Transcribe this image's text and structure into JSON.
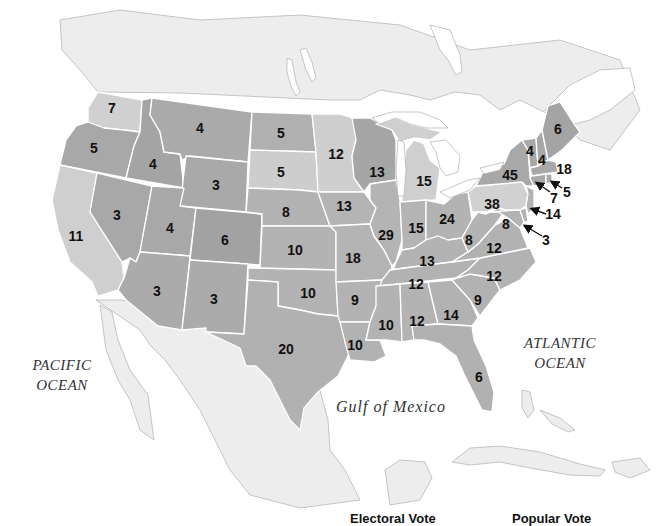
{
  "map": {
    "title": "Electoral votes by state",
    "ocean_labels": {
      "pacific_line1": "PACIFIC",
      "pacific_line2": "OCEAN",
      "atlantic_line1": "ATLANTIC",
      "atlantic_line2": "OCEAN",
      "gulf": "Gulf of Mexico"
    },
    "colors": {
      "state_dark": "#a6a6a6",
      "state_mid": "#b4b4b4",
      "state_light": "#cfcfcf",
      "border": "#ffffff",
      "label": "#111111"
    },
    "states": [
      {
        "name": "Washington",
        "abbr": "WA",
        "votes": "7",
        "shade": "light"
      },
      {
        "name": "Oregon",
        "abbr": "OR",
        "votes": "5",
        "shade": "dark"
      },
      {
        "name": "California",
        "abbr": "CA",
        "votes": "11",
        "shade": "light"
      },
      {
        "name": "Idaho",
        "abbr": "ID",
        "votes": "4",
        "shade": "dark"
      },
      {
        "name": "Nevada",
        "abbr": "NV",
        "votes": "3",
        "shade": "dark"
      },
      {
        "name": "Montana",
        "abbr": "MT",
        "votes": "4",
        "shade": "dark"
      },
      {
        "name": "Wyoming",
        "abbr": "WY",
        "votes": "3",
        "shade": "dark"
      },
      {
        "name": "Utah",
        "abbr": "UT",
        "votes": "4",
        "shade": "dark"
      },
      {
        "name": "Colorado",
        "abbr": "CO",
        "votes": "6",
        "shade": "dark"
      },
      {
        "name": "Arizona",
        "abbr": "AZ",
        "votes": "3",
        "shade": "dark"
      },
      {
        "name": "New Mexico",
        "abbr": "NM",
        "votes": "3",
        "shade": "dark"
      },
      {
        "name": "North Dakota",
        "abbr": "ND",
        "votes": "5",
        "shade": "dark"
      },
      {
        "name": "South Dakota",
        "abbr": "SD",
        "votes": "5",
        "shade": "light"
      },
      {
        "name": "Nebraska",
        "abbr": "NE",
        "votes": "8",
        "shade": "dark"
      },
      {
        "name": "Kansas",
        "abbr": "KS",
        "votes": "10",
        "shade": "dark"
      },
      {
        "name": "Oklahoma",
        "abbr": "OK",
        "votes": "10",
        "shade": "dark"
      },
      {
        "name": "Texas",
        "abbr": "TX",
        "votes": "20",
        "shade": "dark"
      },
      {
        "name": "Minnesota",
        "abbr": "MN",
        "votes": "12",
        "shade": "light"
      },
      {
        "name": "Iowa",
        "abbr": "IA",
        "votes": "13",
        "shade": "dark"
      },
      {
        "name": "Missouri",
        "abbr": "MO",
        "votes": "18",
        "shade": "dark"
      },
      {
        "name": "Arkansas",
        "abbr": "AR",
        "votes": "9",
        "shade": "dark"
      },
      {
        "name": "Louisiana",
        "abbr": "LA",
        "votes": "10",
        "shade": "dark"
      },
      {
        "name": "Wisconsin",
        "abbr": "WI",
        "votes": "13",
        "shade": "dark"
      },
      {
        "name": "Illinois",
        "abbr": "IL",
        "votes": "29",
        "shade": "dark"
      },
      {
        "name": "Michigan",
        "abbr": "MI",
        "votes": "15",
        "shade": "light"
      },
      {
        "name": "Indiana",
        "abbr": "IN",
        "votes": "15",
        "shade": "dark"
      },
      {
        "name": "Ohio",
        "abbr": "OH",
        "votes": "24",
        "shade": "dark"
      },
      {
        "name": "Kentucky",
        "abbr": "KY",
        "votes": "13",
        "shade": "dark"
      },
      {
        "name": "Tennessee",
        "abbr": "TN",
        "votes": "12",
        "shade": "dark"
      },
      {
        "name": "Mississippi",
        "abbr": "MS",
        "votes": "10",
        "shade": "dark"
      },
      {
        "name": "Alabama",
        "abbr": "AL",
        "votes": "12",
        "shade": "dark"
      },
      {
        "name": "Georgia",
        "abbr": "GA",
        "votes": "14",
        "shade": "dark"
      },
      {
        "name": "Florida",
        "abbr": "FL",
        "votes": "6",
        "shade": "dark"
      },
      {
        "name": "South Carolina",
        "abbr": "SC",
        "votes": "9",
        "shade": "dark"
      },
      {
        "name": "North Carolina",
        "abbr": "NC",
        "votes": "12",
        "shade": "dark"
      },
      {
        "name": "Virginia",
        "abbr": "VA",
        "votes": "12",
        "shade": "dark"
      },
      {
        "name": "West Virginia",
        "abbr": "WV",
        "votes": "8",
        "shade": "dark"
      },
      {
        "name": "Maryland",
        "abbr": "MD",
        "votes": "8",
        "shade": "dark"
      },
      {
        "name": "Delaware",
        "abbr": "DE",
        "votes": "3",
        "shade": "dark"
      },
      {
        "name": "New Jersey",
        "abbr": "NJ",
        "votes": "14",
        "shade": "dark"
      },
      {
        "name": "Pennsylvania",
        "abbr": "PA",
        "votes": "38",
        "shade": "light"
      },
      {
        "name": "New York",
        "abbr": "NY",
        "votes": "45",
        "shade": "dark"
      },
      {
        "name": "Connecticut",
        "abbr": "CT",
        "votes": "7",
        "shade": "dark"
      },
      {
        "name": "Rhode Island",
        "abbr": "RI",
        "votes": "5",
        "shade": "dark"
      },
      {
        "name": "Massachusetts",
        "abbr": "MA",
        "votes": "18",
        "shade": "dark"
      },
      {
        "name": "Vermont",
        "abbr": "VT",
        "votes": "4",
        "shade": "dark"
      },
      {
        "name": "New Hampshire",
        "abbr": "NH",
        "votes": "4",
        "shade": "dark"
      },
      {
        "name": "Maine",
        "abbr": "ME",
        "votes": "6",
        "shade": "dark"
      }
    ]
  },
  "legend": {
    "electoral_vote": "Electoral Vote",
    "popular_vote": "Popular Vote"
  }
}
